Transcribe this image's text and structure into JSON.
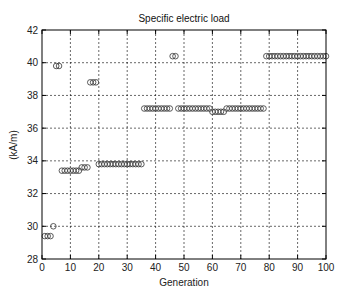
{
  "chart_data": {
    "type": "scatter",
    "title": "Specific electric load",
    "xlabel": "Generation",
    "ylabel": "(kA/m)",
    "xlim": [
      0,
      100
    ],
    "ylim": [
      28,
      42
    ],
    "xticks": [
      0,
      10,
      20,
      30,
      40,
      50,
      60,
      70,
      80,
      90,
      100
    ],
    "yticks": [
      28,
      30,
      32,
      34,
      36,
      38,
      40,
      42
    ],
    "grid": true,
    "marker": "circle-open",
    "series": [
      {
        "name": "Specific electric load",
        "x": [
          1,
          2,
          3,
          4,
          5,
          6,
          7,
          8,
          9,
          10,
          11,
          12,
          13,
          14,
          15,
          16,
          17,
          18,
          19,
          20,
          21,
          22,
          23,
          24,
          25,
          26,
          27,
          28,
          29,
          30,
          31,
          32,
          33,
          34,
          35,
          36,
          37,
          38,
          39,
          40,
          41,
          42,
          43,
          44,
          45,
          46,
          47,
          48,
          49,
          50,
          51,
          52,
          53,
          54,
          55,
          56,
          57,
          58,
          59,
          60,
          61,
          62,
          63,
          64,
          65,
          66,
          67,
          68,
          69,
          70,
          71,
          72,
          73,
          74,
          75,
          76,
          77,
          78,
          79,
          80,
          81,
          82,
          83,
          84,
          85,
          86,
          87,
          88,
          89,
          90,
          91,
          92,
          93,
          94,
          95,
          96,
          97,
          98,
          99,
          100
        ],
        "values": [
          29.4,
          29.4,
          29.4,
          30.0,
          39.8,
          39.8,
          33.4,
          33.4,
          33.4,
          33.4,
          33.4,
          33.4,
          33.4,
          33.6,
          33.6,
          33.6,
          38.8,
          38.8,
          38.8,
          33.8,
          33.8,
          33.8,
          33.8,
          33.8,
          33.8,
          33.8,
          33.8,
          33.8,
          33.8,
          33.8,
          33.8,
          33.8,
          33.8,
          33.8,
          33.8,
          37.2,
          37.2,
          37.2,
          37.2,
          37.2,
          37.2,
          37.2,
          37.2,
          37.2,
          37.2,
          40.4,
          40.4,
          37.2,
          37.2,
          37.2,
          37.2,
          37.2,
          37.2,
          37.2,
          37.2,
          37.2,
          37.2,
          37.2,
          37.2,
          37.0,
          37.0,
          37.0,
          37.0,
          37.0,
          37.2,
          37.2,
          37.2,
          37.2,
          37.2,
          37.2,
          37.2,
          37.2,
          37.2,
          37.2,
          37.2,
          37.2,
          37.2,
          37.2,
          40.4,
          40.4,
          40.4,
          40.4,
          40.4,
          40.4,
          40.4,
          40.4,
          40.4,
          40.4,
          40.4,
          40.4,
          40.4,
          40.4,
          40.4,
          40.4,
          40.4,
          40.4,
          40.4,
          40.4,
          40.4,
          40.4
        ]
      }
    ]
  },
  "layout": {
    "plot": {
      "left": 42,
      "top": 30,
      "right": 326,
      "bottom": 259
    },
    "colors": {
      "axis": "#000000",
      "grid": "#000000",
      "marker": "#333333",
      "background": "#ffffff"
    }
  }
}
